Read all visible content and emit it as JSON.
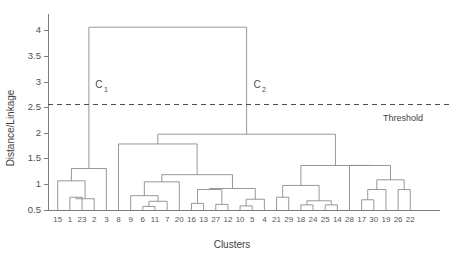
{
  "chart_data": {
    "type": "line",
    "subtype": "dendrogram",
    "title": "",
    "xlabel": "Clusters",
    "ylabel": "Distance/Linkage",
    "ylim": [
      0.5,
      4.25
    ],
    "yticks": [
      0.5,
      1,
      1.5,
      2,
      2.5,
      3,
      3.5,
      4
    ],
    "ytick_labels": [
      "0.5",
      "1",
      "1.5",
      "2",
      "2.5",
      "3",
      "3.5",
      "4"
    ],
    "grid": false,
    "legend_position": "none",
    "leaf_order": [
      "15",
      "1",
      "23",
      "2",
      "3",
      "8",
      "9",
      "6",
      "11",
      "7",
      "20",
      "16",
      "13",
      "27",
      "12",
      "10",
      "5",
      "4",
      "21",
      "29",
      "18",
      "24",
      "25",
      "14",
      "28",
      "17",
      "30",
      "19",
      "26",
      "22"
    ],
    "leaf_count": 30,
    "baseline": 0.5,
    "threshold": {
      "value": 2.56,
      "label": "Threshold",
      "style": "dashed"
    },
    "annotations": [
      {
        "base": "C",
        "sub": "1",
        "x_leaf_index": 4.05,
        "y": 2.88
      },
      {
        "base": "C",
        "sub": "2",
        "x_leaf_index": 17.05,
        "y": 2.88
      }
    ],
    "merges": [
      {
        "id": "m1",
        "left": {
          "type": "leaf",
          "index": 1
        },
        "right": {
          "type": "leaf",
          "index": 2
        },
        "height": 0.75
      },
      {
        "id": "m2",
        "left": {
          "type": "leaf",
          "index": 3
        },
        "right": {
          "type": "node",
          "id": "m1"
        },
        "height": 0.72
      },
      {
        "id": "m3",
        "left": {
          "type": "leaf",
          "index": 0
        },
        "right": {
          "type": "node",
          "id": "m2"
        },
        "height": 1.07
      },
      {
        "id": "m4",
        "left": {
          "type": "node",
          "id": "m3"
        },
        "right": {
          "type": "leaf",
          "index": 4
        },
        "height": 1.31
      },
      {
        "id": "m5",
        "left": {
          "type": "leaf",
          "index": 7
        },
        "right": {
          "type": "leaf",
          "index": 8
        },
        "height": 0.57
      },
      {
        "id": "m6",
        "left": {
          "type": "node",
          "id": "m5"
        },
        "right": {
          "type": "leaf",
          "index": 9
        },
        "height": 0.67
      },
      {
        "id": "m7",
        "left": {
          "type": "leaf",
          "index": 6
        },
        "right": {
          "type": "node",
          "id": "m6"
        },
        "height": 0.78
      },
      {
        "id": "m8",
        "left": {
          "type": "node",
          "id": "m7"
        },
        "right": {
          "type": "leaf",
          "index": 10
        },
        "height": 1.05
      },
      {
        "id": "m9",
        "left": {
          "type": "leaf",
          "index": 11
        },
        "right": {
          "type": "leaf",
          "index": 12
        },
        "height": 0.63
      },
      {
        "id": "m10",
        "left": {
          "type": "leaf",
          "index": 13
        },
        "right": {
          "type": "leaf",
          "index": 14
        },
        "height": 0.61
      },
      {
        "id": "m11",
        "left": {
          "type": "node",
          "id": "m9"
        },
        "right": {
          "type": "node",
          "id": "m10"
        },
        "height": 0.9
      },
      {
        "id": "m12",
        "left": {
          "type": "leaf",
          "index": 15
        },
        "right": {
          "type": "leaf",
          "index": 16
        },
        "height": 0.58
      },
      {
        "id": "m13",
        "left": {
          "type": "node",
          "id": "m12"
        },
        "right": {
          "type": "leaf",
          "index": 17
        },
        "height": 0.71
      },
      {
        "id": "m14",
        "left": {
          "type": "node",
          "id": "m11"
        },
        "right": {
          "type": "node",
          "id": "m13"
        },
        "height": 0.92
      },
      {
        "id": "m15",
        "left": {
          "type": "node",
          "id": "m8"
        },
        "right": {
          "type": "node",
          "id": "m14"
        },
        "height": 1.19
      },
      {
        "id": "m16",
        "left": {
          "type": "leaf",
          "index": 5
        },
        "right": {
          "type": "node",
          "id": "m15"
        },
        "height": 1.79
      },
      {
        "id": "m17",
        "left": {
          "type": "leaf",
          "index": 18
        },
        "right": {
          "type": "leaf",
          "index": 19
        },
        "height": 0.75
      },
      {
        "id": "m18",
        "left": {
          "type": "leaf",
          "index": 20
        },
        "right": {
          "type": "leaf",
          "index": 21
        },
        "height": 0.6
      },
      {
        "id": "m19",
        "left": {
          "type": "leaf",
          "index": 22
        },
        "right": {
          "type": "leaf",
          "index": 23
        },
        "height": 0.6
      },
      {
        "id": "m20",
        "left": {
          "type": "node",
          "id": "m18"
        },
        "right": {
          "type": "node",
          "id": "m19"
        },
        "height": 0.68
      },
      {
        "id": "m21",
        "left": {
          "type": "node",
          "id": "m17"
        },
        "right": {
          "type": "node",
          "id": "m20"
        },
        "height": 0.98
      },
      {
        "id": "m22",
        "left": {
          "type": "leaf",
          "index": 25
        },
        "right": {
          "type": "leaf",
          "index": 26
        },
        "height": 0.7
      },
      {
        "id": "m23",
        "left": {
          "type": "node",
          "id": "m22"
        },
        "right": {
          "type": "leaf",
          "index": 27
        },
        "height": 0.9
      },
      {
        "id": "m24",
        "left": {
          "type": "leaf",
          "index": 28
        },
        "right": {
          "type": "leaf",
          "index": 29
        },
        "height": 0.9
      },
      {
        "id": "m25",
        "left": {
          "type": "node",
          "id": "m23"
        },
        "right": {
          "type": "node",
          "id": "m24"
        },
        "height": 1.09
      },
      {
        "id": "m26",
        "left": {
          "type": "leaf",
          "index": 24
        },
        "right": {
          "type": "node",
          "id": "m25"
        },
        "height": 1.37
      },
      {
        "id": "m27",
        "left": {
          "type": "node",
          "id": "m21"
        },
        "right": {
          "type": "node",
          "id": "m26"
        },
        "height": 1.37
      },
      {
        "id": "m28",
        "left": {
          "type": "node",
          "id": "m16"
        },
        "right": {
          "type": "node",
          "id": "m27"
        },
        "height": 1.98
      },
      {
        "id": "m29",
        "left": {
          "type": "node",
          "id": "m4"
        },
        "right": {
          "type": "node",
          "id": "m28"
        },
        "height": 4.07
      }
    ]
  },
  "colors": {
    "link": "#8c8c8c",
    "axis": "#7d7d7d",
    "threshold": "#4a4a4a",
    "text": "#4f4f4f",
    "background": "#ffffff"
  }
}
